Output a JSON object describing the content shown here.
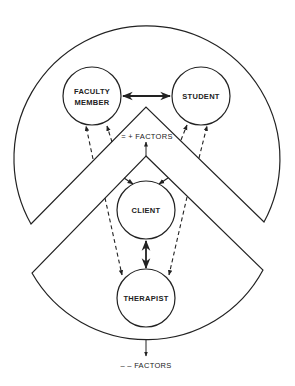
{
  "diagram": {
    "nodes": {
      "faculty_line1": "FACULTY",
      "faculty_line2": "MEMBER",
      "student": "STUDENT",
      "client": "CLIENT",
      "therapist": "THERAPIST"
    },
    "factors": {
      "positive": "= + FACTORS",
      "negative": "– – FACTORS"
    },
    "colors": {
      "stroke": "#222222",
      "background": "#ffffff"
    }
  }
}
